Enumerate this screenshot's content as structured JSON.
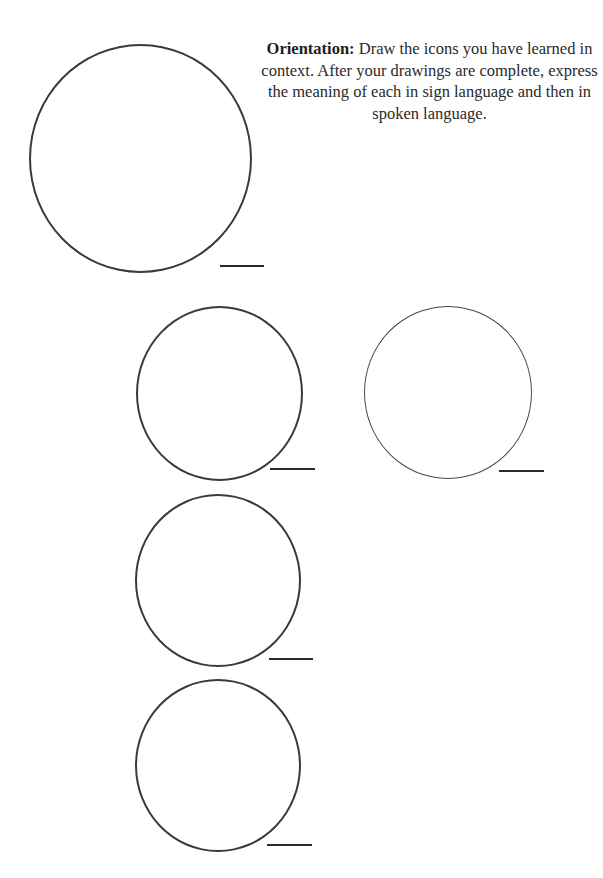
{
  "instructions": {
    "label": "Orientation:",
    "text": "Draw the icons you have learned in context. After your drawings are complete, express the meaning of each in sign language and then in spoken language."
  },
  "drawing_areas": [
    {
      "id": 1,
      "answer_blank": ""
    },
    {
      "id": 2,
      "answer_blank": ""
    },
    {
      "id": 3,
      "answer_blank": ""
    },
    {
      "id": 4,
      "answer_blank": ""
    },
    {
      "id": 5,
      "answer_blank": ""
    }
  ]
}
